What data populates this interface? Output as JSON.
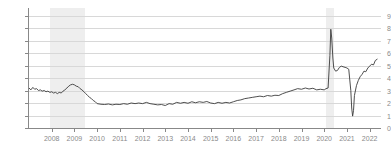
{
  "chart_data": {
    "type": "line",
    "title": "",
    "subtitle": "",
    "xlabel": "",
    "ylabel": "",
    "xlim": [
      2007.0,
      2022.5
    ],
    "ylim": [
      0,
      9.6
    ],
    "grid": true,
    "legend": "none",
    "line_color": "#3b3b3b",
    "grid_color": "#d8d8d8",
    "axis_color": "#888888",
    "tick_label_color": "#8a8a8a",
    "recession_band_color": "#eeeeee",
    "y_ticks": [
      0,
      1,
      2,
      3,
      4,
      5,
      6,
      7,
      8,
      9
    ],
    "y_tick_labels": [
      "0",
      "1",
      "2",
      "3",
      "4",
      "5",
      "6",
      "7",
      "8",
      "9"
    ],
    "x_ticks": [
      2008,
      2009,
      2010,
      2011,
      2012,
      2013,
      2014,
      2015,
      2016,
      2017,
      2018,
      2019,
      2020,
      2021,
      2022
    ],
    "x_tick_labels": [
      "2008",
      "2009",
      "2010",
      "2011",
      "2012",
      "2013",
      "2014",
      "2015",
      "2016",
      "2017",
      "2018",
      "2019",
      "2020",
      "2021",
      "2022"
    ],
    "shaded_regions": [
      {
        "name": "recession-2008",
        "x_start": 2007.92,
        "x_end": 2009.45
      },
      {
        "name": "recession-2020",
        "x_start": 2020.08,
        "x_end": 2020.42
      }
    ],
    "series": [
      {
        "name": "rate",
        "x": [
          2007.0,
          2007.08,
          2007.17,
          2007.25,
          2007.33,
          2007.42,
          2007.5,
          2007.58,
          2007.67,
          2007.75,
          2007.83,
          2007.92,
          2008.0,
          2008.08,
          2008.17,
          2008.25,
          2008.33,
          2008.42,
          2008.5,
          2008.58,
          2008.67,
          2008.75,
          2008.83,
          2008.92,
          2009.0,
          2009.08,
          2009.17,
          2009.25,
          2009.33,
          2009.42,
          2009.5,
          2009.58,
          2009.67,
          2009.75,
          2009.83,
          2009.92,
          2010.0,
          2010.17,
          2010.33,
          2010.5,
          2010.67,
          2010.83,
          2011.0,
          2011.17,
          2011.33,
          2011.5,
          2011.67,
          2011.83,
          2012.0,
          2012.17,
          2012.33,
          2012.5,
          2012.67,
          2012.83,
          2013.0,
          2013.17,
          2013.33,
          2013.5,
          2013.67,
          2013.83,
          2014.0,
          2014.17,
          2014.33,
          2014.5,
          2014.67,
          2014.83,
          2015.0,
          2015.17,
          2015.33,
          2015.5,
          2015.67,
          2015.83,
          2016.0,
          2016.17,
          2016.33,
          2016.5,
          2016.67,
          2016.83,
          2017.0,
          2017.17,
          2017.33,
          2017.5,
          2017.67,
          2017.83,
          2018.0,
          2018.17,
          2018.33,
          2018.5,
          2018.67,
          2018.83,
          2019.0,
          2019.17,
          2019.33,
          2019.5,
          2019.67,
          2019.83,
          2020.0,
          2020.08,
          2020.17,
          2020.25,
          2020.29,
          2020.33,
          2020.38,
          2020.42,
          2020.5,
          2020.58,
          2020.67,
          2020.75,
          2020.83,
          2020.92,
          2021.0,
          2021.08,
          2021.17,
          2021.21,
          2021.25,
          2021.29,
          2021.33,
          2021.42,
          2021.5,
          2021.58,
          2021.67,
          2021.75,
          2021.83,
          2021.92,
          2022.0,
          2022.08,
          2022.17,
          2022.25,
          2022.33
        ],
        "y": [
          3.2,
          3.05,
          3.25,
          3.1,
          3.15,
          3.0,
          3.05,
          2.95,
          3.0,
          2.9,
          2.95,
          2.85,
          2.9,
          2.8,
          2.85,
          2.75,
          2.85,
          2.8,
          2.95,
          3.05,
          3.2,
          3.35,
          3.45,
          3.5,
          3.45,
          3.35,
          3.3,
          3.15,
          3.05,
          2.9,
          2.75,
          2.6,
          2.45,
          2.35,
          2.2,
          2.1,
          1.95,
          1.9,
          1.88,
          1.92,
          1.85,
          1.9,
          1.88,
          1.95,
          1.9,
          2.0,
          1.95,
          2.0,
          1.95,
          2.05,
          1.95,
          1.9,
          1.85,
          1.88,
          1.8,
          1.95,
          1.9,
          2.05,
          1.98,
          2.05,
          1.98,
          2.1,
          2.02,
          2.1,
          2.05,
          2.12,
          2.0,
          1.95,
          2.05,
          1.98,
          2.05,
          2.0,
          2.1,
          2.2,
          2.25,
          2.35,
          2.4,
          2.45,
          2.5,
          2.55,
          2.5,
          2.6,
          2.55,
          2.62,
          2.6,
          2.75,
          2.85,
          2.95,
          3.05,
          3.15,
          3.1,
          3.2,
          3.12,
          3.18,
          3.05,
          3.1,
          3.05,
          3.15,
          3.2,
          5.8,
          7.9,
          7.2,
          5.6,
          4.8,
          4.55,
          4.6,
          4.85,
          4.95,
          4.9,
          4.85,
          4.8,
          4.7,
          3.0,
          1.6,
          0.95,
          1.4,
          2.6,
          3.4,
          3.8,
          4.1,
          4.3,
          4.55,
          4.5,
          4.8,
          4.95,
          5.1,
          5.05,
          5.4,
          5.5
        ]
      }
    ]
  }
}
